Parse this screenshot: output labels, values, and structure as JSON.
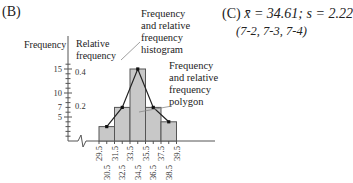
{
  "panel_b": {
    "label": "(B)",
    "freq_axis_label": "Frequency",
    "rel_axis_label_1": "Relative",
    "rel_axis_label_2": "frequency",
    "ann_hist": [
      "Frequency",
      "and relative",
      "frequency",
      "histogram"
    ],
    "ann_poly": [
      "Frequency",
      "and relative",
      "frequency",
      "polygon"
    ],
    "y_ticks_freq": [
      "15",
      "10",
      "7",
      "5"
    ],
    "y_ticks_rel": [
      "0.4",
      "0.2"
    ]
  },
  "panel_c": {
    "label": "(C)",
    "mean_text": "x̄ = 34.61;",
    "sd_text": "s = 2.22",
    "refs": "(7-2, 7-3, 7-4)"
  },
  "chart_data": {
    "type": "bar",
    "xlabel": "",
    "ylabel": "Frequency / Relative frequency",
    "boundaries": [
      "29.5",
      "31.5",
      "33.5",
      "35.5",
      "37.5",
      "39.5"
    ],
    "midpoints": [
      "30.5",
      "32.5",
      "34.5",
      "36.5",
      "38.5"
    ],
    "categories": [
      "29.5-31.5",
      "31.5-33.5",
      "33.5-35.5",
      "35.5-37.5",
      "37.5-39.5"
    ],
    "values": [
      3,
      7,
      15,
      7,
      4
    ],
    "values_note": "approximate, read from bar heights against the frequency axis",
    "relative_values": [
      0.083,
      0.194,
      0.417,
      0.194,
      0.111
    ],
    "polygon": {
      "x": [
        30.5,
        32.5,
        34.5,
        36.5,
        38.5
      ],
      "y": [
        3,
        7,
        15,
        7,
        4
      ]
    },
    "ylim": [
      0,
      16
    ],
    "secondary_axis": {
      "label": "Relative frequency",
      "ticks": [
        0.2,
        0.4
      ]
    },
    "grid": false,
    "annotations": [
      "Frequency and relative frequency histogram",
      "Frequency and relative frequency polygon"
    ]
  }
}
